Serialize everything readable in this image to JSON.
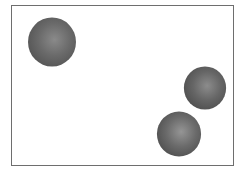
{
  "scene": {
    "frame": {
      "border_color": "#6e6e6e",
      "background": "#ffffff"
    },
    "spheres": [
      {
        "id": "sphere-1",
        "cx": 52,
        "cy": 42,
        "r": 25,
        "color": "#6a6a6a",
        "highlight": "#8a8a8a",
        "shadow": "#555555"
      },
      {
        "id": "sphere-2",
        "cx": 205,
        "cy": 88,
        "r": 22,
        "color": "#666666",
        "highlight": "#8c8c8c",
        "shadow": "#4f4f4f"
      },
      {
        "id": "sphere-3",
        "cx": 179,
        "cy": 134,
        "r": 23,
        "color": "#6b6b6b",
        "highlight": "#959595",
        "shadow": "#505050"
      }
    ]
  }
}
